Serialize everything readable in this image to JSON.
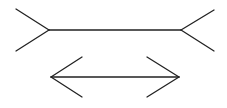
{
  "diagram": {
    "name": "Müller-Lyer illusion",
    "figures": [
      {
        "id": "top",
        "fin_style": "outward-fins"
      },
      {
        "id": "bottom",
        "fin_style": "inward-arrowheads"
      }
    ],
    "stroke_color": "#222222",
    "background_color": "#ffffff"
  }
}
